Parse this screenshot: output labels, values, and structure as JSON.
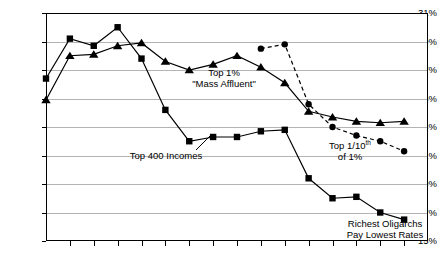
{
  "chart_data": {
    "type": "line",
    "title": "",
    "subtitle": "",
    "xlabel": "",
    "ylabel": "",
    "ylim": [
      15,
      31
    ],
    "ytick_values": [
      15,
      17,
      19,
      21,
      23,
      25,
      27,
      29,
      31
    ],
    "ytick_labels": [
      "15%",
      "17%",
      "19%",
      "21%",
      "23%",
      "25%",
      "27%",
      "29%",
      "31%"
    ],
    "grid": true,
    "legend_position": "inline-annotations",
    "xtick_count": 16,
    "xtick_labels": [],
    "x": [
      0,
      1,
      2,
      3,
      4,
      5,
      6,
      7,
      8,
      9,
      10,
      11,
      12,
      13,
      14,
      15,
      16
    ],
    "series": [
      {
        "name": "Top 400 Incomes",
        "marker": "square",
        "linestyle": "solid",
        "color": "#000000",
        "x": [
          0,
          1,
          2,
          3,
          4,
          5,
          6,
          7,
          8,
          9,
          10,
          11,
          12,
          13,
          14,
          15,
          16
        ],
        "values": [
          26.4,
          29.2,
          28.7,
          30.0,
          27.8,
          24.2,
          22.0,
          22.3,
          22.3,
          22.7,
          22.8,
          19.4,
          18.0,
          18.1,
          17.0,
          16.5,
          null
        ]
      },
      {
        "name": "Top 1% 'Mass Affluent'",
        "marker": "triangle",
        "linestyle": "solid",
        "color": "#000000",
        "x": [
          0,
          1,
          2,
          3,
          4,
          5,
          6,
          7,
          8,
          9,
          10,
          11,
          12,
          13,
          14,
          15,
          16
        ],
        "values": [
          24.9,
          28.0,
          28.1,
          28.7,
          28.9,
          27.6,
          27.0,
          27.4,
          28.0,
          27.2,
          26.1,
          24.1,
          23.7,
          23.4,
          23.3,
          23.4,
          null
        ]
      },
      {
        "name": "Top 1/10th of 1%",
        "marker": "circle",
        "linestyle": "dashed",
        "color": "#000000",
        "x": [
          9,
          10,
          11,
          12,
          13,
          14,
          15
        ],
        "values": [
          28.5,
          28.8,
          24.6,
          23.0,
          22.4,
          22.0,
          21.3
        ]
      }
    ],
    "annotations": [
      {
        "id": "top-1-percent",
        "line1": "Top 1%",
        "line2": "\"Mass Affluent\"",
        "x": 224,
        "y": 67
      },
      {
        "id": "top-400-incomes",
        "line1": "Top 400 Incomes",
        "line2": "",
        "x": 166,
        "y": 150
      },
      {
        "id": "top-tenth-of-1-percent",
        "line1_pre": "Top 1/10",
        "line1_sup": "th",
        "line2": "of 1%",
        "x": 350,
        "y": 140
      },
      {
        "id": "richest-oligarchs",
        "line1": "Richest Oligarchs",
        "line2": "Pay Lowest Rates",
        "x": 385,
        "y": 218
      }
    ],
    "colors": {
      "series_stroke": "#000000",
      "gridline": "#b3b3b3",
      "axis": "#000000",
      "background": "#ffffff"
    }
  }
}
